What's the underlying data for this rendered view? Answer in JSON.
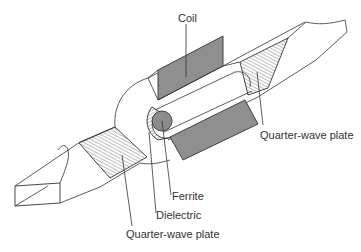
{
  "figure": {
    "labels": {
      "coil": "Coil",
      "quarter_wave_plate_right": "Quarter-wave plate",
      "ferrite": "Ferrite",
      "dielectric": "Dielectric",
      "quarter_wave_plate_left": "Quarter-wave plate"
    },
    "colors": {
      "line": "#333333",
      "coil_fill": "#8f8f8f",
      "ferrite_fill": "#8c8c8c",
      "background": "#ffffff"
    }
  }
}
